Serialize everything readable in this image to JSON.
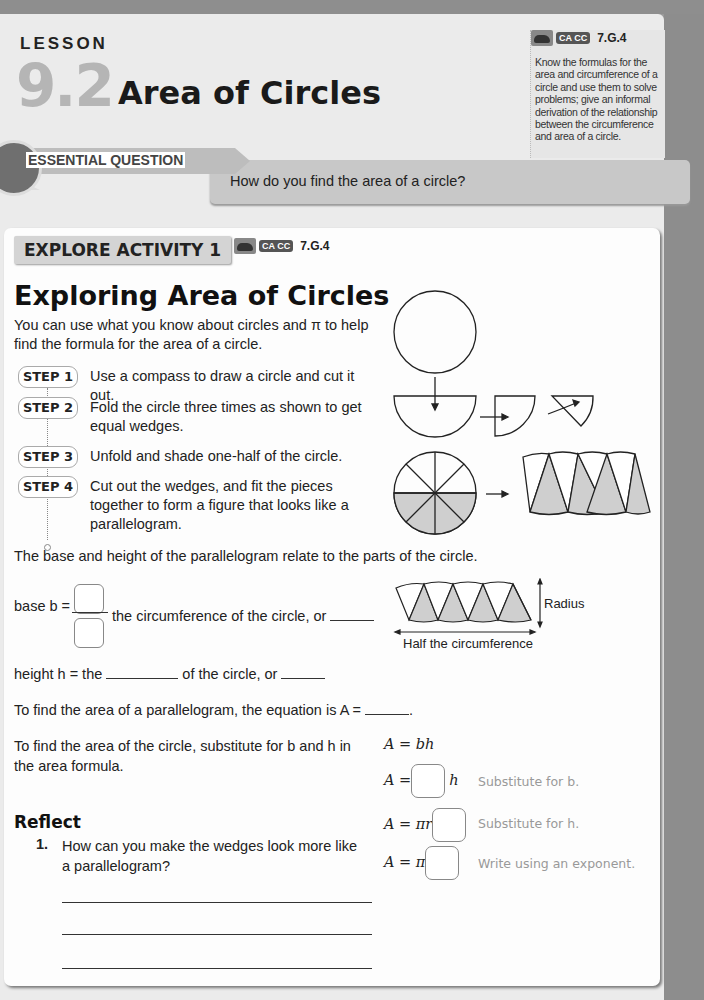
{
  "header": {
    "lesson_label": "LESSON",
    "lesson_number": "9.2",
    "lesson_title": "Area of Circles"
  },
  "standard": {
    "badge": "CA CC",
    "code": "7.G.4",
    "description": "Know the formulas for the area and circumference of a circle and use them to solve problems; give an informal derivation of the relationship between the circumference and area of a circle."
  },
  "essential_question": {
    "label": "ESSENTIAL QUESTION",
    "question": "How do you find the area of a circle?"
  },
  "explore": {
    "tag": "EXPLORE ACTIVITY 1",
    "badge": "CA CC",
    "code": "7.G.4",
    "title": "Exploring Area of Circles",
    "intro": "You can use what you know about circles and π to help find the formula for the area of a circle.",
    "steps": [
      {
        "label": "STEP 1",
        "text": "Use a compass to draw a circle and cut it out."
      },
      {
        "label": "STEP 2",
        "text": "Fold the circle three times as shown to get equal wedges."
      },
      {
        "label": "STEP 3",
        "text": "Unfold and shade one-half of the circle."
      },
      {
        "label": "STEP 4",
        "text": "Cut out the wedges, and fit the pieces together to form a figure that looks like a parallelogram."
      }
    ],
    "relation_text": "The base and height of the parallelogram relate to the parts of the circle.",
    "base_prefix": "base b =",
    "base_suffix": "the circumference of the circle, or",
    "height_prefix": "height h = the",
    "height_suffix": "of the circle, or",
    "parallelogram_eq": "To find the area of a parallelogram, the equation is A =",
    "substitute_text": "To find the area of the circle, substitute for b and h in the area formula.",
    "diagram_labels": {
      "radius": "Radius",
      "half_circ": "Half the circumference"
    },
    "formulas": [
      {
        "lhs": "A = bh",
        "hint": ""
      },
      {
        "lhs": "A =",
        "after": "h",
        "hint": "Substitute for b."
      },
      {
        "lhs": "A = πr",
        "after": "",
        "hint": "Substitute for h."
      },
      {
        "lhs": "A = π",
        "after": "",
        "hint": "Write using an exponent."
      }
    ]
  },
  "reflect": {
    "heading": "Reflect",
    "questions": [
      {
        "num": "1.",
        "text": "How can you make the wedges look more like a parallelogram?"
      }
    ]
  }
}
